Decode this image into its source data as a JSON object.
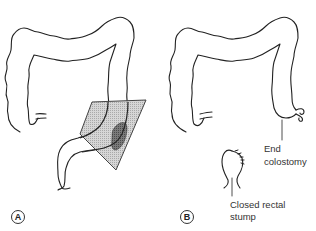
{
  "figure": {
    "type": "anatomical line illustration",
    "colors": {
      "outline": "#222222",
      "resection_fill": "#c8c8c8",
      "resection_edge": "#555555",
      "tumor_fill": "#6b6b6b",
      "background": "#ffffff"
    }
  },
  "panels": [
    {
      "id": "A",
      "badge": "A",
      "description": "Large bowel with shaded resection zone over sigmoid colon containing lesion"
    },
    {
      "id": "B",
      "badge": "B",
      "description": "Large bowel after resection with end colostomy and closed rectal stump",
      "labels": {
        "end_colostomy_line1": "End",
        "end_colostomy_line2": "colostomy",
        "rectal_stump_line1": "Closed rectal",
        "rectal_stump_line2": "stump"
      }
    }
  ]
}
